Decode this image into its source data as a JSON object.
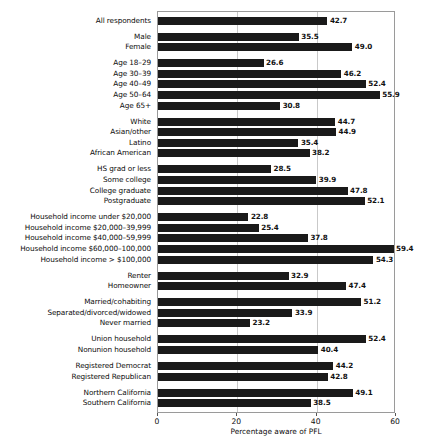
{
  "chart_data": {
    "type": "bar",
    "orientation": "horizontal",
    "title": "",
    "xlabel": "Percentage aware of PFL",
    "ylabel": "",
    "xlim": [
      0,
      60
    ],
    "xticks": [
      0,
      20,
      40,
      60
    ],
    "xtick_labels": [
      "0",
      "20",
      "40",
      "60"
    ],
    "grid": true,
    "grid_axis": "x",
    "legend": false,
    "bar_color": "#1a1a1a",
    "grid_color": "#c9c9c9",
    "frame_color": "#9a9a9a",
    "value_label_format": "one-decimal",
    "categories": [
      "All respondents",
      "Male",
      "Female",
      "Age 18–29",
      "Age 30–39",
      "Age 40–49",
      "Age 50–64",
      "Age 65+",
      "White",
      "Asian/other",
      "Latino",
      "African American",
      "HS grad or less",
      "Some college",
      "College graduate",
      "Postgraduate",
      "Household income under $20,000",
      "Household income $20,000–39,999",
      "Household income $40,000–59,999",
      "Household income $60,000–100,000",
      "Household income > $100,000",
      "Renter",
      "Homeowner",
      "Married/cohabiting",
      "Separated/divorced/widowed",
      "Never married",
      "Union household",
      "Nonunion household",
      "Registered Democrat",
      "Registered Republican",
      "Northern California",
      "Southern California"
    ],
    "values": [
      42.7,
      35.5,
      49.0,
      26.6,
      46.2,
      52.4,
      55.9,
      30.8,
      44.7,
      44.9,
      35.4,
      38.2,
      28.5,
      39.9,
      47.8,
      52.1,
      22.8,
      25.4,
      37.8,
      59.4,
      54.3,
      32.9,
      47.4,
      51.2,
      33.9,
      23.2,
      52.4,
      40.4,
      44.2,
      42.8,
      49.1,
      38.5
    ],
    "value_labels": [
      "42.7",
      "35.5",
      "49.0",
      "26.6",
      "46.2",
      "52.4",
      "55.9",
      "30.8",
      "44.7",
      "44.9",
      "35.4",
      "38.2",
      "28.5",
      "39.9",
      "47.8",
      "52.1",
      "22.8",
      "25.4",
      "37.8",
      "59.4",
      "54.3",
      "32.9",
      "47.4",
      "51.2",
      "33.9",
      "23.2",
      "52.4",
      "40.4",
      "44.2",
      "42.8",
      "49.1",
      "38.5"
    ],
    "groups": [
      {
        "name": "overall",
        "start": 0,
        "count": 1
      },
      {
        "name": "gender",
        "start": 1,
        "count": 2
      },
      {
        "name": "age",
        "start": 3,
        "count": 5
      },
      {
        "name": "race-ethnicity",
        "start": 8,
        "count": 4
      },
      {
        "name": "education",
        "start": 12,
        "count": 4
      },
      {
        "name": "household-income",
        "start": 16,
        "count": 5
      },
      {
        "name": "housing-tenure",
        "start": 21,
        "count": 2
      },
      {
        "name": "marital-status",
        "start": 23,
        "count": 3
      },
      {
        "name": "union-status",
        "start": 26,
        "count": 2
      },
      {
        "name": "party-registration",
        "start": 28,
        "count": 2
      },
      {
        "name": "region",
        "start": 30,
        "count": 2
      }
    ]
  }
}
